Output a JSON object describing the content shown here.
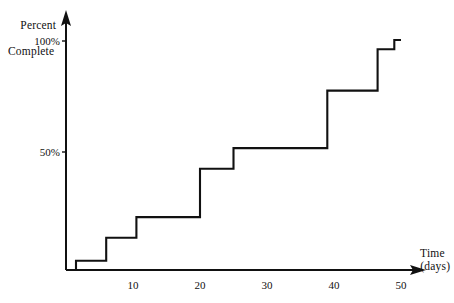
{
  "chart_data": {
    "type": "line",
    "subtype": "step",
    "title": "",
    "xlabel": "Time",
    "xlabel_units": "(days)",
    "ylabel_line1": "Percent",
    "ylabel_line2": "Complete",
    "xlim": [
      0,
      52
    ],
    "ylim": [
      0,
      104
    ],
    "grid": false,
    "legend": false,
    "legend_position": "none",
    "x_ticks": [
      10,
      20,
      30,
      40,
      50
    ],
    "x_tick_labels": [
      "10",
      "20",
      "30",
      "40",
      "50"
    ],
    "y_ticks": [
      50,
      100
    ],
    "y_tick_labels": [
      "50%",
      "100%"
    ],
    "line_color": "#111111",
    "axis_color": "#111111",
    "background_color": "#ffffff",
    "x": [
      0,
      1.5,
      6,
      10.5,
      20,
      25,
      39,
      46.5,
      49,
      50
    ],
    "values": [
      0,
      4,
      14,
      23,
      44,
      53,
      78,
      96,
      100,
      100
    ],
    "series": [
      {
        "name": "Percent Complete",
        "x": [
          0,
          1.5,
          6,
          10.5,
          20,
          25,
          39,
          46.5,
          49,
          50
        ],
        "values": [
          0,
          4,
          14,
          23,
          44,
          53,
          78,
          96,
          100,
          100
        ]
      }
    ],
    "steps": [
      {
        "day": 1.5,
        "percent": 4
      },
      {
        "day": 6,
        "percent": 14
      },
      {
        "day": 10.5,
        "percent": 23
      },
      {
        "day": 20,
        "percent": 44
      },
      {
        "day": 25,
        "percent": 53
      },
      {
        "day": 39,
        "percent": 78
      },
      {
        "day": 46.5,
        "percent": 96
      },
      {
        "day": 49,
        "percent": 100
      }
    ]
  }
}
